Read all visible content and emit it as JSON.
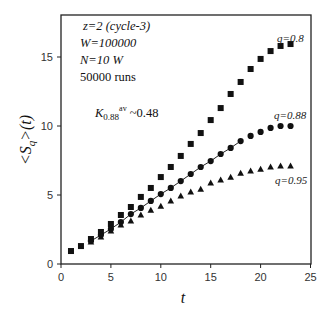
{
  "chart_data": {
    "type": "scatter",
    "title": "",
    "xlabel": "t",
    "ylabel": "<S_q>(t)",
    "xlim": [
      0,
      25
    ],
    "ylim": [
      0,
      17.5
    ],
    "xticks": [
      0,
      5,
      10,
      15,
      20,
      25
    ],
    "yticks": [
      0,
      5,
      10,
      15
    ],
    "grid": false,
    "legend_position": "inline labels at right end of each series",
    "annotations": {
      "lines": [
        "z=2 (cycle-3)",
        "W=100000",
        "N=10 W",
        "50000 runs"
      ],
      "exponent_base": "K",
      "exponent_sub": "0.88",
      "exponent_sup": "av",
      "exponent_value": "~0.48"
    },
    "series": [
      {
        "name": "q=0.8",
        "marker": "square",
        "x": [
          1,
          2,
          3,
          4,
          5,
          6,
          7,
          8,
          9,
          10,
          11,
          12,
          13,
          14,
          15,
          16,
          17,
          18,
          19,
          20,
          21,
          22,
          23
        ],
        "values": [
          0.94,
          1.3,
          1.81,
          2.32,
          2.9,
          3.55,
          4.13,
          4.86,
          5.51,
          6.3,
          7.03,
          7.83,
          8.7,
          9.49,
          10.43,
          11.3,
          12.32,
          13.19,
          14.13,
          14.86,
          15.43,
          15.8,
          15.94
        ]
      },
      {
        "name": "q=0.88",
        "marker": "circle",
        "fit_line": true,
        "x": [
          3,
          4,
          5,
          6,
          7,
          8,
          9,
          10,
          11,
          12,
          13,
          14,
          15,
          16,
          17,
          18,
          19,
          20,
          21,
          22,
          23
        ],
        "values": [
          1.67,
          2.1,
          2.54,
          3.04,
          3.62,
          4.06,
          4.57,
          5.07,
          5.51,
          6.01,
          6.52,
          7.03,
          7.46,
          7.97,
          8.41,
          8.91,
          9.28,
          9.57,
          9.86,
          10.0,
          10.0
        ]
      },
      {
        "name": "q=0.95",
        "marker": "triangle",
        "x": [
          3,
          4,
          5,
          6,
          7,
          8,
          9,
          10,
          11,
          12,
          13,
          14,
          15,
          16,
          17,
          18,
          19,
          20,
          21,
          22,
          23
        ],
        "values": [
          1.6,
          1.96,
          2.39,
          2.83,
          3.12,
          3.55,
          3.91,
          4.2,
          4.57,
          4.93,
          5.22,
          5.43,
          5.87,
          6.09,
          6.3,
          6.59,
          6.74,
          6.88,
          7.03,
          7.1,
          7.1
        ]
      }
    ],
    "fit_line": {
      "series": "q=0.88",
      "x_range": [
        3,
        18
      ]
    }
  },
  "labels": {
    "x_axis": "t",
    "y_axis_main": "<S",
    "y_axis_sub": "q",
    "y_axis_rest": ">(t)",
    "ann1": "z=2 (cycle-3)",
    "ann2": "W=100000",
    "ann3": "N=10 W",
    "ann4": "50000 runs",
    "k_base": "K",
    "k_sub": "0.88",
    "k_sup": "av",
    "k_val": " ~0.48",
    "s1": "q=0.8",
    "s2": "q=0.88",
    "s3": "q=0.95"
  }
}
